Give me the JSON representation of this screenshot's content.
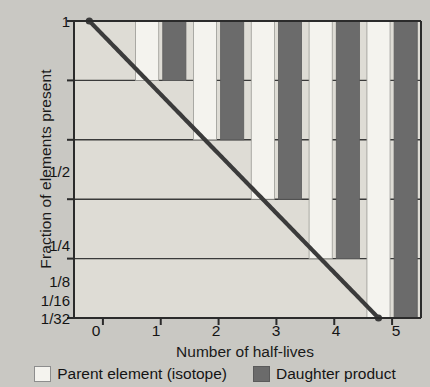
{
  "chart_data": {
    "type": "bar",
    "title": "",
    "xlabel": "Number of half-lives",
    "ylabel": "Fraction of elements present",
    "categories": [
      "0",
      "1",
      "2",
      "3",
      "4",
      "5"
    ],
    "x": [
      0,
      1,
      2,
      3,
      4,
      5
    ],
    "series": [
      {
        "name": "Parent element (isotope)",
        "color": "#f4f3ee",
        "values": [
          1,
          0.5,
          0.25,
          0.125,
          0.0625,
          0.03125
        ],
        "value_labels": [
          "1",
          "1/2",
          "1/4",
          "1/8",
          "1/16",
          "1/32"
        ]
      },
      {
        "name": "Daughter product",
        "color": "#6b6b6b",
        "values": [
          0,
          0.5,
          0.75,
          0.875,
          0.9375,
          0.96875
        ],
        "value_labels": [
          "0",
          "1/2",
          "3/4",
          "7/8",
          "15/16",
          "31/32"
        ]
      }
    ],
    "overlay_curve": {
      "name": "Decay curve",
      "color": "#3b3b3b",
      "x": [
        0,
        1,
        2,
        3,
        4,
        5
      ],
      "y": [
        1,
        0.5,
        0.25,
        0.125,
        0.0625,
        0.03125
      ]
    },
    "yticks": [
      1,
      0.5,
      0.25,
      0.125,
      0.0625,
      0.03125
    ],
    "ytick_labels": [
      "1",
      "1/2",
      "1/4",
      "1/8",
      "1/16",
      "1/32"
    ],
    "ylim": [
      0.03125,
      1
    ],
    "yscale": "log2",
    "xtick_labels": [
      "0",
      "1",
      "2",
      "3",
      "4",
      "5"
    ],
    "grid": true,
    "legend_position": "bottom"
  },
  "axes": {
    "y_title": "Fraction of elements present",
    "x_title": "Number of half-lives"
  },
  "legend": {
    "parent_label": "Parent element (isotope)",
    "daughter_label": "Daughter product"
  },
  "colors": {
    "background": "#c9c8c3",
    "plot_background": "#dedcd5",
    "parent_bar": "#f4f3ee",
    "daughter_bar": "#6b6b6b",
    "curve": "#3b3b3b",
    "axis": "#2b2b2b",
    "grid": "#3a3a3a"
  }
}
